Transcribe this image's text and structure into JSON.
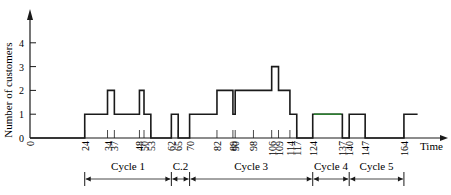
{
  "chart_data": {
    "type": "line",
    "subtype": "step",
    "title": "",
    "xlabel": "Time",
    "ylabel": "Number of customers",
    "xlim": [
      0,
      170
    ],
    "ylim": [
      0,
      5
    ],
    "yticks": [
      0,
      1,
      2,
      3,
      4
    ],
    "xticks": [
      0,
      24,
      34,
      37,
      48,
      50,
      53,
      62,
      65,
      70,
      82,
      89,
      90,
      98,
      106,
      109,
      114,
      117,
      124,
      137,
      140,
      147,
      164
    ],
    "grid": false,
    "legend": null,
    "series": [
      {
        "name": "Number of customers",
        "x": [
          0,
          24,
          34,
          37,
          48,
          50,
          53,
          62,
          65,
          70,
          82,
          89,
          90,
          106,
          109,
          114,
          117,
          124,
          137,
          140,
          147,
          164,
          170
        ],
        "values": [
          0,
          1,
          2,
          1,
          2,
          1,
          0,
          1,
          0,
          1,
          2,
          1,
          2,
          3,
          2,
          1,
          0,
          1,
          0,
          1,
          0,
          1,
          1
        ]
      }
    ],
    "annotations": [
      {
        "label": "Cycle 1",
        "start": 24,
        "end": 62
      },
      {
        "label": "C.2",
        "start": 62,
        "end": 70
      },
      {
        "label": "Cycle 3",
        "start": 70,
        "end": 124
      },
      {
        "label": "Cycle 4",
        "start": 124,
        "end": 140
      },
      {
        "label": "Cycle 5",
        "start": 140,
        "end": 164
      }
    ]
  },
  "colors": {
    "line": "#1a1a1a",
    "highlight_segment": "#2e7d32"
  }
}
